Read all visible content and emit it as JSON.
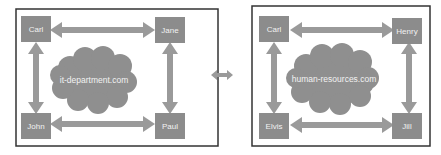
{
  "left": {
    "cloud_label": "it-department.com",
    "nodes": {
      "top_left": "Carl",
      "top_right": "Jane",
      "bottom_left": "John",
      "bottom_right": "Paul"
    }
  },
  "right": {
    "cloud_label": "human-resources.com",
    "nodes": {
      "top_left": "Carl",
      "top_right": "Henry",
      "bottom_left": "Elvis",
      "bottom_right": "Jill"
    }
  },
  "colors": {
    "node": "#8c8c8c",
    "arrow": "#9a9a9a",
    "cloud": "#8f8f8f",
    "frame": "#333333"
  }
}
